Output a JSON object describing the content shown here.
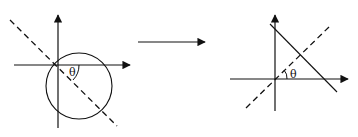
{
  "diagram": {
    "left_panel": {
      "axes": [
        "x-axis",
        "y-axis"
      ],
      "shapes": [
        "circle",
        "dashed-diameter-line"
      ],
      "angle_label": "θ"
    },
    "transition_arrow": {
      "direction": "right"
    },
    "right_panel": {
      "axes": [
        "x-axis",
        "y-axis"
      ],
      "shapes": [
        "solid-line",
        "dashed-line"
      ],
      "angle_label": "θ"
    },
    "colors": {
      "stroke": "#111111",
      "background": "#ffffff"
    }
  }
}
